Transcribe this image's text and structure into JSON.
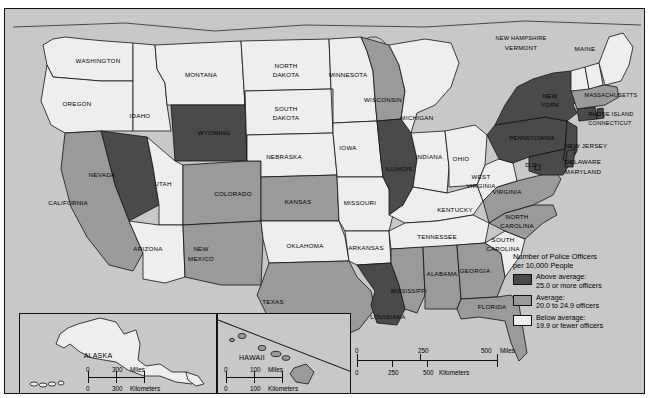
{
  "map": {
    "title_in_legend": "Number of Police Officers per 10,000 People",
    "background_color": "#c8c8c8",
    "colors": {
      "above_average": "#4a4a4a",
      "average": "#9a9a9a",
      "below_average": "#eeeeee",
      "border": "#111111"
    }
  },
  "legend": {
    "title_line1": "Number of Police Officers",
    "title_line2": "per 10,000 People",
    "items": [
      {
        "swatch": "above",
        "line1": "Above average:",
        "line2": "25.0 or more officers"
      },
      {
        "swatch": "avg",
        "line1": "Average:",
        "line2": "20.0 to 24.9 officers"
      },
      {
        "swatch": "below",
        "line1": "Below average:",
        "line2": "19.9 or fewer officers"
      }
    ]
  },
  "scales": {
    "main": {
      "miles": {
        "ticks": [
          "0",
          "250",
          "500"
        ],
        "unit": "Miles"
      },
      "kilometers": {
        "ticks": [
          "0",
          "250",
          "500"
        ],
        "unit": "Kilometers"
      }
    },
    "alaska": {
      "miles": {
        "ticks": [
          "0",
          "300"
        ],
        "unit": "Miles"
      },
      "kilometers": {
        "ticks": [
          "0",
          "300"
        ],
        "unit": "Kilometers"
      }
    },
    "hawaii": {
      "miles": {
        "ticks": [
          "0",
          "100"
        ],
        "unit": "Miles"
      },
      "kilometers": {
        "ticks": [
          "0",
          "100"
        ],
        "unit": "Kilometers"
      }
    }
  },
  "insets": {
    "alaska_label": "ALASKA",
    "hawaii_label": "HAWAII"
  },
  "chart_data": {
    "type": "map",
    "title": "Number of Police Officers per 10,000 People",
    "categories": [
      "Above average: 25.0 or more officers",
      "Average: 20.0 to 24.9 officers",
      "Below average: 19.9 or fewer officers"
    ],
    "states": [
      {
        "name": "WASHINGTON",
        "class": "below"
      },
      {
        "name": "OREGON",
        "class": "below"
      },
      {
        "name": "IDAHO",
        "class": "below"
      },
      {
        "name": "MONTANA",
        "class": "below"
      },
      {
        "name": "WYOMING",
        "class": "above"
      },
      {
        "name": "NEVADA",
        "class": "above"
      },
      {
        "name": "CALIFORNIA",
        "class": "avg"
      },
      {
        "name": "UTAH",
        "class": "below"
      },
      {
        "name": "ARIZONA",
        "class": "below"
      },
      {
        "name": "COLORADO",
        "class": "avg"
      },
      {
        "name": "NEW MEXICO",
        "class": "avg"
      },
      {
        "name": "NORTH DAKOTA",
        "class": "below"
      },
      {
        "name": "SOUTH DAKOTA",
        "class": "below"
      },
      {
        "name": "NEBRASKA",
        "class": "below"
      },
      {
        "name": "KANSAS",
        "class": "avg"
      },
      {
        "name": "OKLAHOMA",
        "class": "below"
      },
      {
        "name": "TEXAS",
        "class": "avg"
      },
      {
        "name": "MINNESOTA",
        "class": "below"
      },
      {
        "name": "IOWA",
        "class": "below"
      },
      {
        "name": "MISSOURI",
        "class": "below"
      },
      {
        "name": "ARKANSAS",
        "class": "below"
      },
      {
        "name": "LOUISIANA",
        "class": "above"
      },
      {
        "name": "WISCONSIN",
        "class": "avg"
      },
      {
        "name": "ILLINOIS",
        "class": "above"
      },
      {
        "name": "MICHIGAN",
        "class": "below"
      },
      {
        "name": "INDIANA",
        "class": "below"
      },
      {
        "name": "OHIO",
        "class": "below"
      },
      {
        "name": "KENTUCKY",
        "class": "below"
      },
      {
        "name": "TENNESSEE",
        "class": "below"
      },
      {
        "name": "MISSISSIPPI",
        "class": "avg"
      },
      {
        "name": "ALABAMA",
        "class": "avg"
      },
      {
        "name": "GEORGIA",
        "class": "avg"
      },
      {
        "name": "FLORIDA",
        "class": "avg"
      },
      {
        "name": "SOUTH CAROLINA",
        "class": "below"
      },
      {
        "name": "NORTH CAROLINA",
        "class": "avg"
      },
      {
        "name": "VIRGINIA",
        "class": "avg"
      },
      {
        "name": "WEST VIRGINIA",
        "class": "below"
      },
      {
        "name": "MARYLAND",
        "class": "above"
      },
      {
        "name": "DELAWARE",
        "class": "above"
      },
      {
        "name": "D.C.",
        "class": "above"
      },
      {
        "name": "PENNSYLVANIA",
        "class": "above"
      },
      {
        "name": "NEW JERSEY",
        "class": "above"
      },
      {
        "name": "NEW YORK",
        "class": "above"
      },
      {
        "name": "CONNECTICUT",
        "class": "above"
      },
      {
        "name": "RHODE ISLAND",
        "class": "above"
      },
      {
        "name": "MASSACHUSETTS",
        "class": "avg"
      },
      {
        "name": "VERMONT",
        "class": "below"
      },
      {
        "name": "NEW HAMPSHIRE",
        "class": "below"
      },
      {
        "name": "MAINE",
        "class": "below"
      },
      {
        "name": "ALASKA",
        "class": "below"
      },
      {
        "name": "HAWAII",
        "class": "avg"
      }
    ],
    "labels": [
      {
        "text": "WASHINGTON",
        "x": 93,
        "y": 52
      },
      {
        "text": "OREGON",
        "x": 72,
        "y": 95
      },
      {
        "text": "IDAHO",
        "x": 135,
        "y": 107
      },
      {
        "text": "MONTANA",
        "x": 196,
        "y": 66
      },
      {
        "text": "WYOMING",
        "x": 209,
        "y": 124
      },
      {
        "text": "NEVADA",
        "x": 97,
        "y": 166
      },
      {
        "text": "CALIFORNIA",
        "x": 63,
        "y": 194
      },
      {
        "text": "UTAH",
        "x": 158,
        "y": 175
      },
      {
        "text": "ARIZONA",
        "x": 143,
        "y": 240
      },
      {
        "text": "COLORADO",
        "x": 228,
        "y": 185
      },
      {
        "text": "NEW",
        "x": 196,
        "y": 240
      },
      {
        "text": "MEXICO",
        "x": 196,
        "y": 250
      },
      {
        "text": "NORTH",
        "x": 281,
        "y": 57
      },
      {
        "text": "DAKOTA",
        "x": 281,
        "y": 66
      },
      {
        "text": "SOUTH",
        "x": 281,
        "y": 100
      },
      {
        "text": "DAKOTA",
        "x": 281,
        "y": 109
      },
      {
        "text": "NEBRASKA",
        "x": 279,
        "y": 148
      },
      {
        "text": "KANSAS",
        "x": 293,
        "y": 193
      },
      {
        "text": "OKLAHOMA",
        "x": 300,
        "y": 237
      },
      {
        "text": "TEXAS",
        "x": 268,
        "y": 293
      },
      {
        "text": "MINNESOTA",
        "x": 343,
        "y": 66
      },
      {
        "text": "IOWA",
        "x": 343,
        "y": 139
      },
      {
        "text": "MISSOURI",
        "x": 355,
        "y": 194
      },
      {
        "text": "ARKANSAS",
        "x": 361,
        "y": 239
      },
      {
        "text": "LOUISIANA",
        "x": 383,
        "y": 308
      },
      {
        "text": "WISCONSIN",
        "x": 378,
        "y": 91
      },
      {
        "text": "ILLINOIS",
        "x": 394,
        "y": 160
      },
      {
        "text": "MICHIGAN",
        "x": 412,
        "y": 109
      },
      {
        "text": "INDIANA",
        "x": 424,
        "y": 148
      },
      {
        "text": "OHIO",
        "x": 456,
        "y": 150
      },
      {
        "text": "KENTUCKY",
        "x": 450,
        "y": 201
      },
      {
        "text": "TENNESSEE",
        "x": 432,
        "y": 228
      },
      {
        "text": "MISSISSIPPI",
        "x": 404,
        "y": 283
      },
      {
        "text": "ALABAMA",
        "x": 437,
        "y": 265
      },
      {
        "text": "GEORGIA",
        "x": 470,
        "y": 262
      },
      {
        "text": "FLORIDA",
        "x": 487,
        "y": 298
      },
      {
        "text": "SOUTH",
        "x": 498,
        "y": 231
      },
      {
        "text": "CAROLINA",
        "x": 498,
        "y": 240
      },
      {
        "text": "NORTH",
        "x": 512,
        "y": 208
      },
      {
        "text": "CAROLINA",
        "x": 512,
        "y": 217
      },
      {
        "text": "VIRGINIA",
        "x": 502,
        "y": 183
      },
      {
        "text": "WEST",
        "x": 476,
        "y": 168
      },
      {
        "text": "VIRGINIA",
        "x": 476,
        "y": 177
      },
      {
        "text": "MARYLAND",
        "x": 578,
        "y": 163
      },
      {
        "text": "DELAWARE",
        "x": 578,
        "y": 153
      },
      {
        "text": "D.C.",
        "x": 527,
        "y": 156
      },
      {
        "text": "PENNSYLVANIA",
        "x": 527,
        "y": 130
      },
      {
        "text": "NEW JERSEY",
        "x": 581,
        "y": 137
      },
      {
        "text": "NEW",
        "x": 545,
        "y": 87
      },
      {
        "text": "YORK",
        "x": 545,
        "y": 96
      },
      {
        "text": "CONNECTICUT",
        "x": 605,
        "y": 115
      },
      {
        "text": "RHODE ISLAND",
        "x": 606,
        "y": 106
      },
      {
        "text": "MASSACHUSETTS",
        "x": 606,
        "y": 87
      },
      {
        "text": "VERMONT",
        "x": 516,
        "y": 39
      },
      {
        "text": "NEW HAMPSHIRE",
        "x": 516,
        "y": 30
      },
      {
        "text": "MAINE",
        "x": 580,
        "y": 40
      }
    ]
  }
}
